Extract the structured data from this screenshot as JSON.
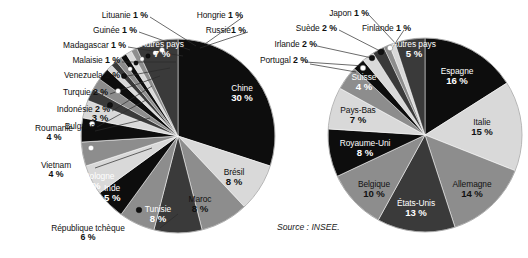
{
  "source_note": "Source : INSEE.",
  "colors": {
    "black": "#0d0d0d",
    "dark": "#3a3a3a",
    "mid": "#8d8d8d",
    "light": "#d9d9d9",
    "white_text": "#ffffff",
    "dark_text": "#111111",
    "background": "#ffffff"
  },
  "chart_data": [
    {
      "type": "pie",
      "title": "",
      "chart_id": "left-pie",
      "unit": "%",
      "total": 100,
      "legend": "none",
      "labels_inside": [
        "Chine",
        "Brésil",
        "Maroc",
        "Tunisie",
        "Inde",
        "Pologne",
        "Autres pays",
        "Bulgarie"
      ],
      "categories": [
        "Chine",
        "Brésil",
        "Maroc",
        "Tunisie",
        "République tchèque",
        "Inde",
        "Pologne",
        "Vietnam",
        "Roumanie",
        "Bulgarie",
        "Indonésie",
        "Turquie",
        "Venezuela",
        "Malaisie",
        "Madagascar",
        "Guinée",
        "Lituanie",
        "Hongrie",
        "Russie",
        "Autres pays"
      ],
      "values": [
        30,
        8,
        8,
        8,
        6,
        5,
        5,
        4,
        4,
        3,
        2,
        2,
        2,
        1,
        1,
        1,
        1,
        1,
        1,
        7
      ],
      "slices": [
        {
          "name": "Chine",
          "value": 30,
          "text": "30 %",
          "fill": "black",
          "label_pos": "inside",
          "label_color": "white"
        },
        {
          "name": "Brésil",
          "value": 8,
          "text": "8 %",
          "fill": "light",
          "label_pos": "inside",
          "label_color": "dark"
        },
        {
          "name": "Maroc",
          "value": 8,
          "text": "8 %",
          "fill": "mid",
          "label_pos": "inside",
          "label_color": "dark"
        },
        {
          "name": "Tunisie",
          "value": 8,
          "text": "8 %",
          "fill": "dark",
          "label_pos": "inside",
          "label_color": "white"
        },
        {
          "name": "République tchèque",
          "value": 6,
          "text": "6 %",
          "fill": "mid",
          "label_pos": "outside",
          "label_color": "dark"
        },
        {
          "name": "Inde",
          "value": 5,
          "text": "5 %",
          "fill": "black",
          "label_pos": "inside",
          "label_color": "white"
        },
        {
          "name": "Pologne",
          "value": 5,
          "text": "5 %",
          "fill": "light",
          "label_pos": "inside",
          "label_color": "dark"
        },
        {
          "name": "Vietnam",
          "value": 4,
          "text": "4 %",
          "fill": "mid",
          "label_pos": "outside",
          "label_color": "dark"
        },
        {
          "name": "Roumanie",
          "value": 4,
          "text": "4 %",
          "fill": "black",
          "label_pos": "outside",
          "label_color": "dark"
        },
        {
          "name": "Bulgarie",
          "value": 3,
          "text": "3 %",
          "fill": "light",
          "label_pos": "split",
          "label_color": "dark"
        },
        {
          "name": "Indonésie",
          "value": 2,
          "text": "2 %",
          "fill": "dark",
          "label_pos": "outside",
          "label_color": "dark"
        },
        {
          "name": "Turquie",
          "value": 2,
          "text": "2 %",
          "fill": "mid",
          "label_pos": "outside",
          "label_color": "dark"
        },
        {
          "name": "Venezuela",
          "value": 2,
          "text": "2 %",
          "fill": "black",
          "label_pos": "outside",
          "label_color": "dark"
        },
        {
          "name": "Malaisie",
          "value": 1,
          "text": "1 %",
          "fill": "light",
          "label_pos": "outside",
          "label_color": "dark"
        },
        {
          "name": "Madagascar",
          "value": 1,
          "text": "1 %",
          "fill": "dark",
          "label_pos": "outside",
          "label_color": "dark"
        },
        {
          "name": "Guinée",
          "value": 1,
          "text": "1 %",
          "fill": "mid",
          "label_pos": "outside",
          "label_color": "dark"
        },
        {
          "name": "Lituanie",
          "value": 1,
          "text": "1 %",
          "fill": "black",
          "label_pos": "outside",
          "label_color": "dark"
        },
        {
          "name": "Hongrie",
          "value": 1,
          "text": "1 %",
          "fill": "light",
          "label_pos": "outside",
          "label_color": "dark"
        },
        {
          "name": "Russie",
          "value": 1,
          "text": "1 %",
          "fill": "mid",
          "label_pos": "outside",
          "label_color": "dark"
        },
        {
          "name": "Autres pays",
          "value": 7,
          "text": "7 %",
          "fill": "dark",
          "label_pos": "inside",
          "label_color": "white"
        }
      ]
    },
    {
      "type": "pie",
      "title": "",
      "chart_id": "right-pie",
      "unit": "%",
      "total": 100,
      "legend": "none",
      "labels_inside": [
        "Espagne",
        "Italie",
        "Allemagne",
        "États-Unis",
        "Belgique",
        "Royaume-Uni",
        "Pays-Bas",
        "Suisse",
        "Autres pays"
      ],
      "categories": [
        "Espagne",
        "Italie",
        "Allemagne",
        "États-Unis",
        "Belgique",
        "Royaume-Uni",
        "Pays-Bas",
        "Suisse",
        "Portugal",
        "Irlande",
        "Suède",
        "Japon",
        "Finlande",
        "Autres pays"
      ],
      "values": [
        16,
        15,
        14,
        13,
        10,
        8,
        7,
        4,
        2,
        2,
        2,
        1,
        1,
        5
      ],
      "slices": [
        {
          "name": "Espagne",
          "value": 16,
          "text": "16 %",
          "fill": "black",
          "label_pos": "inside",
          "label_color": "white"
        },
        {
          "name": "Italie",
          "value": 15,
          "text": "15 %",
          "fill": "light",
          "label_pos": "inside",
          "label_color": "dark"
        },
        {
          "name": "Allemagne",
          "value": 14,
          "text": "14 %",
          "fill": "mid",
          "label_pos": "inside",
          "label_color": "dark"
        },
        {
          "name": "États-Unis",
          "value": 13,
          "text": "13 %",
          "fill": "dark",
          "label_pos": "inside",
          "label_color": "white"
        },
        {
          "name": "Belgique",
          "value": 10,
          "text": "10 %",
          "fill": "mid",
          "label_pos": "inside",
          "label_color": "dark"
        },
        {
          "name": "Royaume-Uni",
          "value": 8,
          "text": "8 %",
          "fill": "black",
          "label_pos": "inside",
          "label_color": "white"
        },
        {
          "name": "Pays-Bas",
          "value": 7,
          "text": "7 %",
          "fill": "light",
          "label_pos": "inside",
          "label_color": "dark"
        },
        {
          "name": "Suisse",
          "value": 4,
          "text": "4 %",
          "fill": "mid",
          "label_pos": "inside",
          "label_color": "white"
        },
        {
          "name": "Portugal",
          "value": 2,
          "text": "2 %",
          "fill": "black",
          "label_pos": "outside",
          "label_color": "dark"
        },
        {
          "name": "Irlande",
          "value": 2,
          "text": "2 %",
          "fill": "light",
          "label_pos": "outside",
          "label_color": "dark"
        },
        {
          "name": "Suède",
          "value": 2,
          "text": "2 %",
          "fill": "dark",
          "label_pos": "outside",
          "label_color": "dark"
        },
        {
          "name": "Japon",
          "value": 1,
          "text": "1 %",
          "fill": "mid",
          "label_pos": "outside",
          "label_color": "dark"
        },
        {
          "name": "Finlande",
          "value": 1,
          "text": "1 %",
          "fill": "light",
          "label_pos": "outside",
          "label_color": "dark"
        },
        {
          "name": "Autres pays",
          "value": 5,
          "text": "5 %",
          "fill": "dark",
          "label_pos": "inside",
          "label_color": "white"
        }
      ]
    }
  ],
  "left_outside_labels": [
    {
      "name": "Lituanie",
      "pct": "1 %",
      "x": 148,
      "y": 10,
      "anchor": "right"
    },
    {
      "name": "Hongrie",
      "pct": "1 %",
      "x": 241,
      "y": 10,
      "anchor": "right"
    },
    {
      "name": "Guinée",
      "pct": "1 %",
      "x": 137,
      "y": 26,
      "anchor": "right"
    },
    {
      "name": "Russie",
      "pct": "1 %",
      "x": 246,
      "y": 26,
      "anchor": "right"
    },
    {
      "name": "Madagascar",
      "pct": "1 %",
      "x": 126,
      "y": 42,
      "anchor": "right"
    },
    {
      "name": "Malaisie",
      "pct": "1 %",
      "x": 120,
      "y": 57,
      "anchor": "right"
    },
    {
      "name": "Venezuela",
      "pct": "2 %",
      "x": 120,
      "y": 72,
      "anchor": "right"
    },
    {
      "name": "Turquie",
      "pct": "2 %",
      "x": 108,
      "y": 89,
      "anchor": "right"
    },
    {
      "name": "Indonésie",
      "pct": "2 %",
      "x": 110,
      "y": 106,
      "anchor": "right"
    },
    {
      "name": "Bulgarie",
      "pct": "",
      "x": 95,
      "y": 122,
      "anchor": "right"
    }
  ],
  "left_outside_stacked": [
    {
      "name": "Roumanie",
      "pct": "4 %",
      "x": 36,
      "y": 125
    },
    {
      "name": "Vietnam",
      "pct": "4 %",
      "x": 40,
      "y": 162
    },
    {
      "name": "République tchèque",
      "pct": "6 %",
      "x": 42,
      "y": 225
    }
  ],
  "right_outside_labels": [
    {
      "name": "Japon",
      "pct": "1 %",
      "x": 367,
      "y": 8,
      "anchor": "right"
    },
    {
      "name": "Suède",
      "pct": "2 %",
      "x": 335,
      "y": 24,
      "anchor": "right"
    },
    {
      "name": "Finlande",
      "pct": "1 %",
      "x": 405,
      "y": 24,
      "anchor": "left"
    },
    {
      "name": "Irlande",
      "pct": "2 %",
      "x": 313,
      "y": 41,
      "anchor": "right"
    },
    {
      "name": "Portugal",
      "pct": "2 %",
      "x": 300,
      "y": 57,
      "anchor": "right"
    }
  ]
}
